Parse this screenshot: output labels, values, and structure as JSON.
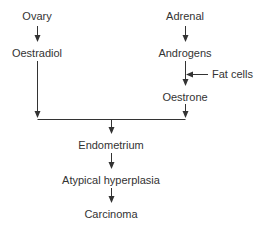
{
  "nodes": {
    "ovary": "Ovary",
    "oestradiol": "Oestradiol",
    "adrenal": "Adrenal",
    "androgens": "Androgens",
    "fat_cells": "Fat cells",
    "oestrone": "Oestrone",
    "endometrium": "Endometrium",
    "atypical_hyperplasia": "Atypical hyperplasia",
    "carcinoma": "Carcinoma"
  },
  "colors": {
    "line": "#333333",
    "text": "#333333",
    "background": "#ffffff"
  }
}
